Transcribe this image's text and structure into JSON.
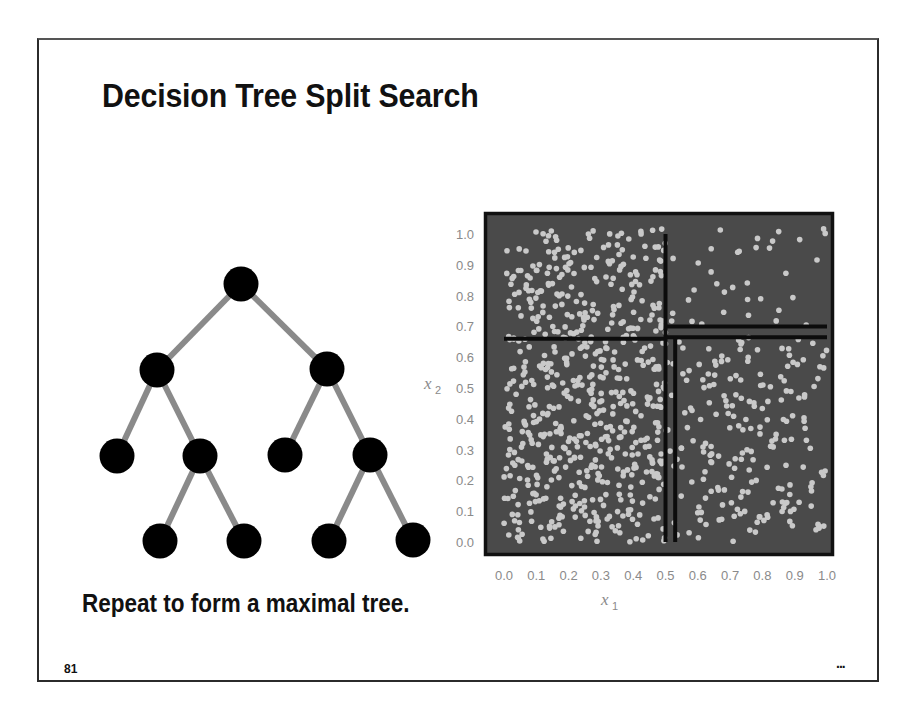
{
  "slide": {
    "title": "Decision Tree Split Search",
    "caption": "Repeat to form a maximal tree.",
    "page_number": "81",
    "continuation_marker": "..."
  },
  "tree": {
    "edge_color": "#8a8a8a",
    "node_color": "#000000",
    "nodes": [
      {
        "id": "root",
        "x": 241,
        "y": 284
      },
      {
        "id": "L",
        "x": 157,
        "y": 370
      },
      {
        "id": "R",
        "x": 327,
        "y": 369
      },
      {
        "id": "LL",
        "x": 117,
        "y": 456
      },
      {
        "id": "LR",
        "x": 200,
        "y": 456
      },
      {
        "id": "RL",
        "x": 285,
        "y": 455
      },
      {
        "id": "RR",
        "x": 370,
        "y": 455
      },
      {
        "id": "LRL",
        "x": 160,
        "y": 541
      },
      {
        "id": "LRR",
        "x": 244,
        "y": 541
      },
      {
        "id": "RRL",
        "x": 329,
        "y": 541
      },
      {
        "id": "RRR",
        "x": 413,
        "y": 540
      }
    ],
    "edges": [
      [
        "root",
        "L"
      ],
      [
        "root",
        "R"
      ],
      [
        "L",
        "LL"
      ],
      [
        "L",
        "LR"
      ],
      [
        "R",
        "RL"
      ],
      [
        "R",
        "RR"
      ],
      [
        "LR",
        "LRL"
      ],
      [
        "LR",
        "LRR"
      ],
      [
        "RR",
        "RRL"
      ],
      [
        "RR",
        "RRR"
      ]
    ]
  },
  "chart_data": {
    "type": "scatter",
    "title": "",
    "xlabel": "x1",
    "ylabel": "x2",
    "xlim": [
      0.0,
      1.0
    ],
    "ylim": [
      0.0,
      1.0
    ],
    "x_ticks": [
      "0.0",
      "0.1",
      "0.2",
      "0.3",
      "0.4",
      "0.5",
      "0.6",
      "0.7",
      "0.8",
      "0.9",
      "1.0"
    ],
    "y_ticks": [
      "0.0",
      "0.1",
      "0.2",
      "0.3",
      "0.4",
      "0.5",
      "0.6",
      "0.7",
      "0.8",
      "0.9",
      "1.0"
    ],
    "background_color": "#4a4a4a",
    "point_color": "#c9c9c9",
    "grid": false,
    "legend": null,
    "split_lines": [
      {
        "orientation": "vertical",
        "x1": 0.5,
        "x2_from": 0.0,
        "x2_to": 1.0
      },
      {
        "orientation": "horizontal",
        "x2": 0.66,
        "x1_from": 0.0,
        "x1_to": 0.5
      },
      {
        "orientation": "horizontal",
        "x2": 0.7,
        "x1_from": 0.5,
        "x1_to": 1.0
      },
      {
        "orientation": "horizontal",
        "x2": 0.665,
        "x1_from": 0.5,
        "x1_to": 1.0
      },
      {
        "orientation": "vertical",
        "x1": 0.53,
        "x2_from": 0.0,
        "x2_to": 0.665
      }
    ],
    "point_regions": [
      {
        "x1_range": [
          0.0,
          0.5
        ],
        "x2_range": [
          0.0,
          0.66
        ],
        "approx_count": 420,
        "density": "high"
      },
      {
        "x1_range": [
          0.0,
          0.5
        ],
        "x2_range": [
          0.66,
          1.02
        ],
        "approx_count": 190,
        "density": "medium"
      },
      {
        "x1_range": [
          0.5,
          1.0
        ],
        "x2_range": [
          0.0,
          0.665
        ],
        "approx_count": 200,
        "density": "medium"
      },
      {
        "x1_range": [
          0.5,
          1.0
        ],
        "x2_range": [
          0.7,
          1.02
        ],
        "approx_count": 35,
        "density": "low"
      }
    ],
    "random_seed": 81
  },
  "axes": {
    "x_label_main": "x",
    "x_label_sub": "1",
    "y_label_main": "x",
    "y_label_sub": "2"
  }
}
